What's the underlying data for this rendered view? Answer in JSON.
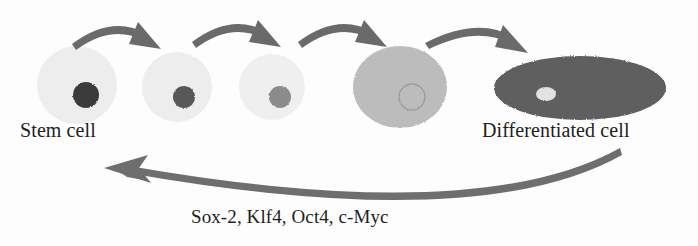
{
  "diagram": {
    "title_labels": {
      "stem_cell": "Stem cell",
      "differentiated_cell": "Differentiated cell",
      "reprogramming_factors": "Sox-2, Klf4, Oct4, c-Myc"
    },
    "colors": {
      "background": "#fdfdfd",
      "arrow": "#6b6b6b",
      "return_arrow": "#6e6e6e",
      "text": "#231f20"
    },
    "cells": [
      {
        "name": "stem-cell",
        "stage": 1,
        "cx": 77,
        "cy": 85,
        "rx": 40,
        "ry": 39,
        "body_color": "#ededed",
        "nucleus": {
          "cx": 86,
          "cy": 95,
          "rx": 13,
          "ry": 13,
          "color": "#3b3b3b",
          "outline_only": false
        }
      },
      {
        "name": "transition-cell-2",
        "stage": 2,
        "cx": 177,
        "cy": 87,
        "rx": 35,
        "ry": 35,
        "body_color": "#ededed",
        "nucleus": {
          "cx": 184,
          "cy": 97,
          "rx": 11,
          "ry": 11,
          "color": "#585858",
          "outline_only": false
        }
      },
      {
        "name": "transition-cell-3",
        "stage": 3,
        "cx": 272,
        "cy": 87,
        "rx": 33,
        "ry": 33,
        "body_color": "#efefef",
        "nucleus": {
          "cx": 280,
          "cy": 97,
          "rx": 11,
          "ry": 11,
          "color": "#8b8b8b",
          "outline_only": false
        }
      },
      {
        "name": "transition-cell-4",
        "stage": 4,
        "cx": 400,
        "cy": 87,
        "rx": 47,
        "ry": 41,
        "body_color": "#bcbcbc",
        "nucleus": {
          "cx": 412,
          "cy": 97,
          "rx": 13,
          "ry": 13,
          "color": "#a3a3a3",
          "outline_only": true
        }
      },
      {
        "name": "differentiated-cell",
        "stage": 5,
        "cx": 580,
        "cy": 88,
        "rx": 86,
        "ry": 32,
        "body_color": "#5e5e5e",
        "nucleus": {
          "cx": 546,
          "cy": 94,
          "rx": 10,
          "ry": 7,
          "color": "#e2e2e2",
          "outline_only": false
        }
      }
    ],
    "differentiation_arrows": [
      {
        "name": "arrow-stage-1-to-2",
        "from_x": 72,
        "to_x": 160
      },
      {
        "name": "arrow-stage-2-to-3",
        "from_x": 186,
        "to_x": 266
      },
      {
        "name": "arrow-stage-3-to-4",
        "from_x": 282,
        "to_x": 370
      },
      {
        "name": "arrow-stage-4-to-5",
        "from_x": 410,
        "to_x": 512
      }
    ],
    "reprogramming_arrow": {
      "name": "reprogramming-arrow",
      "start_x": 622,
      "start_y": 155,
      "end_x": 106,
      "end_y": 168,
      "direction": "right-to-left"
    }
  }
}
